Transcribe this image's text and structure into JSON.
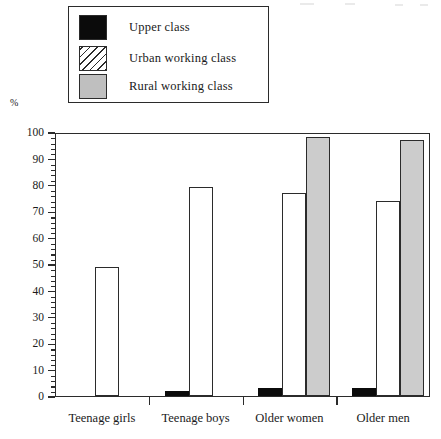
{
  "chart_data": {
    "type": "bar",
    "title": "",
    "xlabel": "",
    "ylabel": "%",
    "ylim": [
      0,
      100
    ],
    "grid": false,
    "legend_position": "top",
    "categories": [
      "Teenage girls",
      "Teenage boys",
      "Older women",
      "Older men"
    ],
    "y_ticks": [
      0,
      10,
      20,
      30,
      40,
      50,
      60,
      70,
      80,
      90,
      100
    ],
    "y_tick_labels": [
      "0",
      "10",
      "20",
      "30",
      "40",
      "50",
      "60",
      "70",
      "80",
      "90",
      "100"
    ],
    "y_minor_tick_step": 2,
    "series": [
      {
        "name": "Upper class",
        "fill": "solid-black",
        "color": "#0b0b0b",
        "values": [
          null,
          2,
          3,
          3
        ]
      },
      {
        "name": "Urban working class",
        "fill": "diagonal-hatch",
        "color": "#ffffff",
        "values": [
          49,
          79,
          77,
          74
        ]
      },
      {
        "name": "Rural working class",
        "fill": "solid-gray",
        "color": "#cccccc",
        "values": [
          null,
          null,
          98,
          97
        ]
      }
    ]
  },
  "legend": {
    "items": [
      {
        "label": "Upper class",
        "swatch": "solid-black"
      },
      {
        "label": "Urban working class",
        "swatch": "diagonal-hatch"
      },
      {
        "label": "Rural working class",
        "swatch": "solid-gray"
      }
    ]
  },
  "axis": {
    "y_unit_label": "%"
  }
}
